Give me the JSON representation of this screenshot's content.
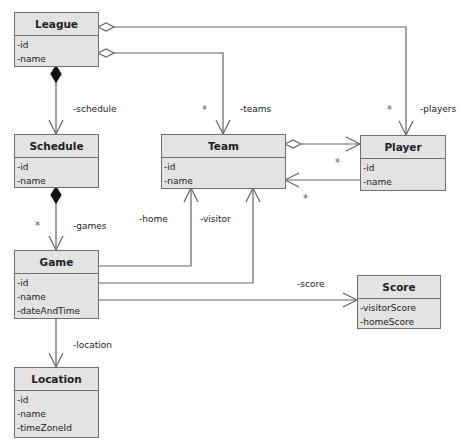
{
  "classes": {
    "league": {
      "name": "League",
      "attrs": [
        "-id",
        "-name"
      ]
    },
    "schedule": {
      "name": "Schedule",
      "attrs": [
        "-id",
        "-name"
      ]
    },
    "team": {
      "name": "Team",
      "attrs": [
        "-id",
        "-name"
      ]
    },
    "player": {
      "name": "Player",
      "attrs": [
        "-id",
        "-name"
      ]
    },
    "game": {
      "name": "Game",
      "attrs": [
        "-id",
        "-name",
        "-dateAndTime"
      ]
    },
    "score": {
      "name": "Score",
      "attrs": [
        "-visitorScore",
        "-homeScore"
      ]
    },
    "location": {
      "name": "Location",
      "attrs": [
        "-id",
        "-name",
        "-timeZoneId"
      ]
    }
  },
  "associations": {
    "schedule": {
      "role": "-schedule"
    },
    "teams": {
      "role": "-teams",
      "multiplicity": "*"
    },
    "players": {
      "role": "-players",
      "multiplicity": "*"
    },
    "games": {
      "role": "-games",
      "multiplicity": "*"
    },
    "team_player": {
      "multiplicity_player": "*",
      "multiplicity_team": "*"
    },
    "home": {
      "role": "-home"
    },
    "visitor": {
      "role": "-visitor"
    },
    "score": {
      "role": "-score"
    },
    "location": {
      "role": "-location"
    }
  },
  "colors": {
    "box_fill": "#e3e3e3",
    "box_border": "#707070",
    "line": "#666666"
  }
}
